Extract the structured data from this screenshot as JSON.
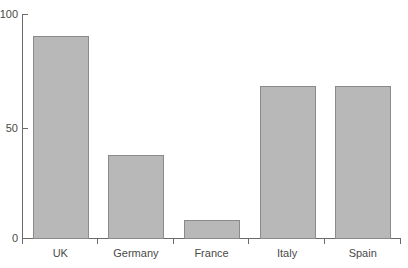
{
  "chart_data": {
    "type": "bar",
    "title": "",
    "subtitle": "",
    "xlabel": "",
    "ylabel": "",
    "categories": [
      "UK",
      "Germany",
      "France",
      "Italy",
      "Spain"
    ],
    "values": [
      90,
      37,
      8,
      68,
      68
    ],
    "ylim": [
      0,
      100
    ],
    "yticks": [
      0,
      50,
      100
    ],
    "ytick_labels": [
      "0",
      "50",
      "100"
    ],
    "grid": false,
    "legend": false,
    "legend_position": "none",
    "bar_fill_color": "#b8b8b8",
    "bar_edge_color": "#8a8a8a",
    "axis_color": "#6b6b6b",
    "text_color": "#4a4a4a",
    "background_color": "#ffffff"
  },
  "axis": {
    "y_tick_0": "0",
    "y_tick_50": "50",
    "y_tick_100": "100"
  },
  "bars": [
    {
      "label": "UK",
      "value": 90
    },
    {
      "label": "Germany",
      "value": 37
    },
    {
      "label": "France",
      "value": 8
    },
    {
      "label": "Italy",
      "value": 68
    },
    {
      "label": "Spain",
      "value": 68
    }
  ]
}
